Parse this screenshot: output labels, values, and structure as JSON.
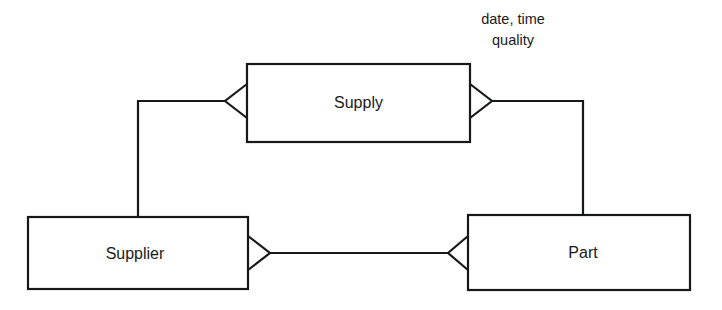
{
  "diagram": {
    "type": "entity-relationship-diagram",
    "notation": "crow's foot",
    "background_color": "#ffffff",
    "line_color": "#16181a",
    "text_color": "#1a1a1a",
    "entities": [
      {
        "id": "supply",
        "label": "Supply",
        "role": "associative-entity",
        "x": 247,
        "y": 64,
        "width": 223,
        "height": 78
      },
      {
        "id": "supplier",
        "label": "Supplier",
        "role": "entity",
        "x": 28,
        "y": 217,
        "width": 220,
        "height": 72
      },
      {
        "id": "part",
        "label": "Part",
        "role": "entity",
        "x": 468,
        "y": 215,
        "width": 222,
        "height": 75
      }
    ],
    "attributes": [
      {
        "id": "supply-attributes",
        "attached_to": "supply",
        "lines": [
          "date, time",
          "quality"
        ]
      }
    ],
    "relationships": [
      {
        "id": "supplier-supply",
        "from": "supplier",
        "to": "supply",
        "from_marker": "none",
        "to_marker": "crows-foot"
      },
      {
        "id": "supply-part",
        "from": "supply",
        "to": "part",
        "from_marker": "crows-foot",
        "to_marker": "none"
      },
      {
        "id": "supplier-part",
        "from": "supplier",
        "to": "part",
        "from_marker": "crows-foot",
        "to_marker": "crows-foot"
      }
    ]
  }
}
